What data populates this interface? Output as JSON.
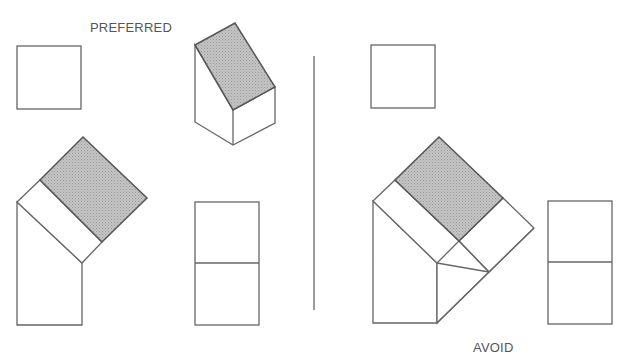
{
  "labels": {
    "preferred": "PREFERRED",
    "avoid": "AVOID"
  },
  "colors": {
    "line": "#666666",
    "shade": "#b8b8b8",
    "background": "#ffffff",
    "text": "#555555"
  },
  "views": {
    "preferred": [
      "top-view-square",
      "isometric-block",
      "auxiliary-view",
      "side-view-rectangle"
    ],
    "avoid": [
      "top-view-square",
      "auxiliary-view-with-extra-band",
      "side-view-rectangle"
    ]
  }
}
